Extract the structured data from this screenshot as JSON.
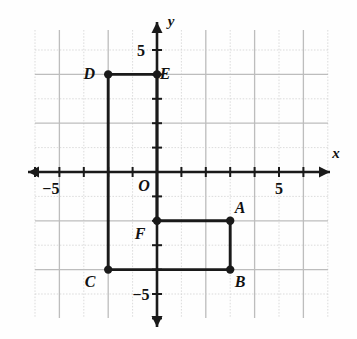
{
  "figure": {
    "type": "coordinate-plane-polygon",
    "axes": {
      "x_label": "x",
      "y_label": "y",
      "origin_label": "O",
      "x_positive_tick_label": "5",
      "x_negative_tick_label": "−5",
      "y_positive_tick_label": "5",
      "y_negative_tick_label": "−5",
      "x_range": [
        -6,
        6
      ],
      "y_range": [
        -6,
        6
      ],
      "tick_interval": 1,
      "grid": true
    },
    "colors": {
      "grid": "#d2d2d2",
      "grid_major": "#bdbdbd",
      "axis": "#1a1a1a",
      "shape": "#1a1a1a",
      "background": "#fefefe"
    },
    "points": [
      {
        "label": "A",
        "x": 3,
        "y": -2,
        "label_dx": 10,
        "label_dy": -8
      },
      {
        "label": "B",
        "x": 3,
        "y": -4,
        "label_dx": 10,
        "label_dy": 17
      },
      {
        "label": "C",
        "x": -2,
        "y": -4,
        "label_dx": -18,
        "label_dy": 17
      },
      {
        "label": "D",
        "x": -2,
        "y": 4,
        "label_dx": -19,
        "label_dy": 5
      },
      {
        "label": "E",
        "x": 0,
        "y": 4,
        "label_dx": 8,
        "label_dy": 5
      },
      {
        "label": "F",
        "x": 0,
        "y": -2,
        "label_dx": -17,
        "label_dy": 18
      }
    ],
    "polygon_order": [
      "A",
      "B",
      "C",
      "D",
      "E",
      "F"
    ],
    "closed": true
  }
}
